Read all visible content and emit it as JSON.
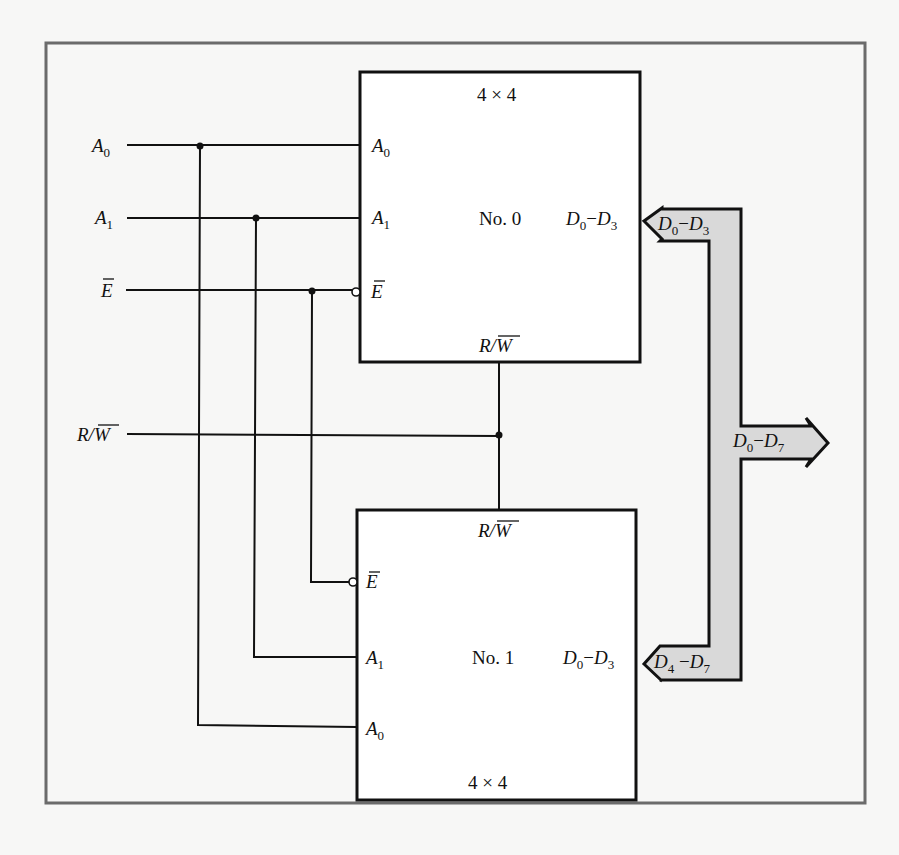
{
  "diagram": {
    "inputs": [
      {
        "name": "A",
        "sub": "0",
        "overbar": false
      },
      {
        "name": "A",
        "sub": "1",
        "overbar": false
      },
      {
        "name": "E",
        "sub": "",
        "overbar": true
      },
      {
        "name": "R/W",
        "sub": "",
        "overbar": "W"
      }
    ],
    "chip0": {
      "size": "4 × 4",
      "name": "No. 0",
      "pins": {
        "a0": "A",
        "a0_sub": "0",
        "a1": "A",
        "a1_sub": "1",
        "e": "E",
        "rw_r": "R/",
        "rw_w": "W",
        "data_d": "D",
        "data_sub0": "0",
        "data_dash": "−",
        "data_sub1": "3"
      }
    },
    "chip1": {
      "size": "4 × 4",
      "name": "No. 1",
      "pins": {
        "a0": "A",
        "a0_sub": "0",
        "a1": "A",
        "a1_sub": "1",
        "e": "E",
        "rw_r": "R/",
        "rw_w": "W",
        "data_d": "D",
        "data_sub0": "0",
        "data_dash": "−",
        "data_sub1": "3"
      }
    },
    "bus": {
      "upper": {
        "d": "D",
        "s0": "0",
        "dash": "−",
        "s1": "3"
      },
      "lower": {
        "d": "D",
        "s0": "4",
        "dash": " −",
        "s1": "7"
      },
      "out": {
        "d": "D",
        "s0": "0",
        "dash": "−",
        "s1": "7"
      },
      "fill": "#d9d9d9"
    },
    "colors": {
      "line": "#111111",
      "frame": "#6b6b6b",
      "background": "#f7f7f6"
    }
  }
}
